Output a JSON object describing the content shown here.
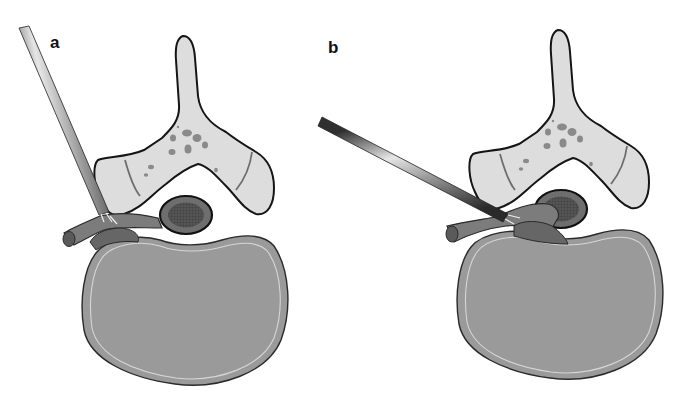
{
  "figure": {
    "panels": [
      {
        "label": "a",
        "description": "Steep posterolateral cannula trajectory reaching the foramen",
        "cannula_angle": "near-vertical"
      },
      {
        "label": "b",
        "description": "Shallow lateral cannula trajectory reaching the foramen",
        "cannula_angle": "oblique-lateral"
      }
    ],
    "structures": [
      "cannula-icon",
      "vertebral-arch-icon",
      "spinal-canal-icon",
      "nerve-root-icon",
      "vertebral-body-icon"
    ],
    "colors": {
      "background": "#ffffff",
      "outline": "#1a1a1a",
      "bone": "#dcdcdc",
      "bone_spots": "#8a8a8a",
      "vertebral_body": "#9a9a9a",
      "vertebral_body_rim": "#d8d8d8",
      "nerve": "#7a7a7a",
      "nerve_dark": "#5e5e5e",
      "canal_outer": "#6e6e6e",
      "canal_inner": "#4a4a4a",
      "cannula_light": "#e0e0e0",
      "cannula_dark": "#3a3a3a"
    }
  }
}
